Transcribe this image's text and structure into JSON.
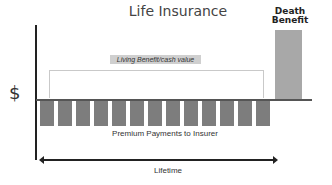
{
  "title": "Life Insurance",
  "y_axis_label": "$",
  "death_benefit": {
    "label_line1": "Death",
    "label_line2": "Benefit",
    "color": "#a8a8a8"
  },
  "living_benefit_label": "Living Benefit/cash value",
  "premium_label": "Premium Payments to Insurer",
  "premium_color": "#7d7d7d",
  "premium_bar_count": 13,
  "lifetime_label": "Lifetime"
}
